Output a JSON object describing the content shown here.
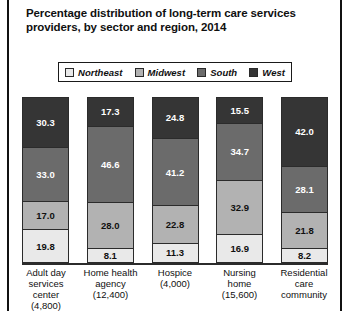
{
  "title": "Percentage distribution of long-term care services providers, by sector and region, 2014",
  "legend": {
    "items": [
      {
        "label": "Northeast",
        "color": "#e9e9e9"
      },
      {
        "label": "Midwest",
        "color": "#b2b2b2"
      },
      {
        "label": "South",
        "color": "#6b6b6b"
      },
      {
        "label": "West",
        "color": "#353535"
      }
    ]
  },
  "categories": [
    {
      "name": "Adult day services center",
      "count": "(4,800)",
      "lines": [
        "Adult day",
        "services center",
        "(4,800)"
      ]
    },
    {
      "name": "Home health agency",
      "count": "(12,400)",
      "lines": [
        "Home health",
        "agency",
        "(12,400)"
      ]
    },
    {
      "name": "Hospice",
      "count": "(4,000)",
      "lines": [
        "Hospice",
        "(4,000)"
      ]
    },
    {
      "name": "Nursing home",
      "count": "(15,600)",
      "lines": [
        "Nursing",
        "home",
        "(15,600)"
      ]
    },
    {
      "name": "Residential care community",
      "count": "",
      "lines": [
        "Residential",
        "care",
        "community"
      ]
    }
  ],
  "bars": [
    {
      "segments": [
        {
          "region": "West",
          "value": "30.3",
          "color": "#353535",
          "text": "#ffffff"
        },
        {
          "region": "South",
          "value": "33.0",
          "color": "#6b6b6b",
          "text": "#ffffff"
        },
        {
          "region": "Midwest",
          "value": "17.0",
          "color": "#b2b2b2",
          "text": "#101010"
        },
        {
          "region": "Northeast",
          "value": "19.8",
          "color": "#e9e9e9",
          "text": "#101010"
        }
      ]
    },
    {
      "segments": [
        {
          "region": "West",
          "value": "17.3",
          "color": "#353535",
          "text": "#ffffff"
        },
        {
          "region": "South",
          "value": "46.6",
          "color": "#6b6b6b",
          "text": "#ffffff"
        },
        {
          "region": "Midwest",
          "value": "28.0",
          "color": "#b2b2b2",
          "text": "#101010"
        },
        {
          "region": "Northeast",
          "value": "8.1",
          "color": "#e9e9e9",
          "text": "#101010"
        }
      ]
    },
    {
      "segments": [
        {
          "region": "West",
          "value": "24.8",
          "color": "#353535",
          "text": "#ffffff"
        },
        {
          "region": "South",
          "value": "41.2",
          "color": "#6b6b6b",
          "text": "#ffffff"
        },
        {
          "region": "Midwest",
          "value": "22.8",
          "color": "#b2b2b2",
          "text": "#101010"
        },
        {
          "region": "Northeast",
          "value": "11.3",
          "color": "#e9e9e9",
          "text": "#101010"
        }
      ]
    },
    {
      "segments": [
        {
          "region": "West",
          "value": "15.5",
          "color": "#353535",
          "text": "#ffffff"
        },
        {
          "region": "South",
          "value": "34.7",
          "color": "#6b6b6b",
          "text": "#ffffff"
        },
        {
          "region": "Midwest",
          "value": "32.9",
          "color": "#b2b2b2",
          "text": "#101010"
        },
        {
          "region": "Northeast",
          "value": "16.9",
          "color": "#e9e9e9",
          "text": "#101010"
        }
      ]
    },
    {
      "segments": [
        {
          "region": "West",
          "value": "42.0",
          "color": "#353535",
          "text": "#ffffff"
        },
        {
          "region": "South",
          "value": "28.1",
          "color": "#6b6b6b",
          "text": "#ffffff"
        },
        {
          "region": "Midwest",
          "value": "21.8",
          "color": "#b2b2b2",
          "text": "#101010"
        },
        {
          "region": "Northeast",
          "value": "8.2",
          "color": "#e9e9e9",
          "text": "#101010"
        }
      ]
    }
  ],
  "chart_data": {
    "type": "bar",
    "title": "Percentage distribution of long-term care services providers, by sector and region, 2014",
    "subtitle": "",
    "xlabel": "",
    "ylabel": "",
    "ylim": [
      0,
      100
    ],
    "stacked": true,
    "normalized_percent": true,
    "grid": false,
    "legend_position": "top",
    "categories": [
      "Adult day services center (4,800)",
      "Home health agency (12,400)",
      "Hospice (4,000)",
      "Nursing home (15,600)",
      "Residential care community"
    ],
    "series": [
      {
        "name": "Northeast",
        "color": "#e9e9e9",
        "values": [
          19.8,
          8.1,
          11.3,
          16.9,
          8.2
        ]
      },
      {
        "name": "Midwest",
        "color": "#b2b2b2",
        "values": [
          17.0,
          28.0,
          22.8,
          32.9,
          21.8
        ]
      },
      {
        "name": "South",
        "color": "#6b6b6b",
        "values": [
          33.0,
          46.6,
          41.2,
          34.7,
          28.1
        ]
      },
      {
        "name": "West",
        "color": "#353535",
        "values": [
          30.3,
          17.3,
          24.8,
          15.5,
          42.0
        ]
      }
    ],
    "stack_order_bottom_to_top": [
      "Northeast",
      "Midwest",
      "South",
      "West"
    ],
    "provider_counts": [
      "4,800",
      "12,400",
      "4,000",
      "15,600",
      ""
    ]
  }
}
